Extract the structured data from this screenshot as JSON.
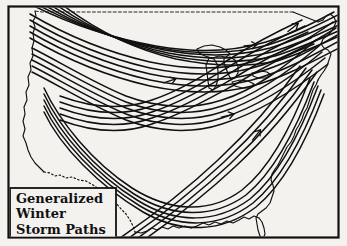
{
  "figure": {
    "title": "Generalized Winter Storm Paths",
    "medium": "hand-drawn pen-and-ink map",
    "region": "United States",
    "background_color": "#f4f2ee",
    "ink_color": "#111111",
    "frame": {
      "present": true,
      "color": "#111111",
      "x": 8,
      "y": 6,
      "width": 331,
      "height": 232
    }
  },
  "legend": {
    "box": {
      "x": 10,
      "y": 188,
      "width": 106,
      "height": 52,
      "border_color": "#111111"
    },
    "line1": "Generalized",
    "line2": "Winter",
    "line3": "Storm Paths"
  },
  "map_features": {
    "coastline_label": "us-coastline",
    "great_lakes_label": "great-lakes",
    "mexico_border_label": "mexico-border-dotted",
    "florida_label": "florida-peninsula",
    "canada_border_label": "canada-border"
  },
  "storm_paths": [
    {
      "name": "northern-pacific-track",
      "origin": "Pacific Northwest",
      "destination": "New England",
      "lines_in_bundle": 6
    },
    {
      "name": "northern-plains-track",
      "origin": "Northwest",
      "destination": "Great Lakes",
      "lines_in_bundle": 5
    },
    {
      "name": "central-plains-track",
      "origin": "Northwest",
      "destination": "Mid-Atlantic",
      "lines_in_bundle": 5
    },
    {
      "name": "southwest-track",
      "origin": "Southwest",
      "destination": "Great Lakes",
      "lines_in_bundle": 5
    },
    {
      "name": "gulf-coast-track",
      "origin": "Texas Gulf",
      "destination": "Atlantic Seaboard",
      "lines_in_bundle": 5
    },
    {
      "name": "southern-atlantic-track",
      "origin": "Gulf of Mexico",
      "destination": "Northeast",
      "lines_in_bundle": 4
    }
  ],
  "direction_arrows": [
    {
      "name": "arrow-central-plains",
      "x": 172,
      "y": 80,
      "angle": -18
    },
    {
      "name": "arrow-great-lakes-east",
      "x": 253,
      "y": 45,
      "angle": -6
    },
    {
      "name": "arrow-ohio-valley",
      "x": 230,
      "y": 115,
      "angle": -14
    },
    {
      "name": "arrow-atlantic-seaboard",
      "x": 258,
      "y": 133,
      "angle": -52
    },
    {
      "name": "arrow-northeast-exit",
      "x": 295,
      "y": 26,
      "angle": -38
    }
  ]
}
